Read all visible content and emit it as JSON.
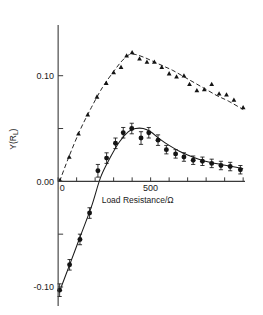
{
  "chart_data": {
    "type": "scatter",
    "title": "",
    "xlabel": "Load Resistance/Ω",
    "ylabel": "Y(Rₗ)",
    "ylabel_parts": {
      "main": "Y(R",
      "sub": "L",
      "tail": ")"
    },
    "xlim": [
      -25,
      1010
    ],
    "ylim": [
      -0.118,
      0.148
    ],
    "grid": false,
    "legend": "none",
    "x_ticks": [
      0,
      100,
      200,
      300,
      400,
      500,
      600,
      700,
      800,
      900,
      1000
    ],
    "x_tick_labels": [
      "0",
      "",
      "",
      "",
      "",
      "500",
      "",
      "",
      "",
      "",
      ""
    ],
    "y_ticks": [
      -0.1,
      -0.05,
      0.0,
      0.05,
      0.1
    ],
    "y_tick_labels": [
      "-0.10",
      "",
      "0.00",
      "",
      "0.10"
    ],
    "series": [
      {
        "name": "upper-series",
        "marker": "triangle",
        "fit_style": "dashed",
        "x": [
          10,
          60,
          110,
          160,
          210,
          260,
          300,
          340,
          370,
          400,
          440,
          480,
          520,
          560,
          600,
          640,
          680,
          710,
          750,
          790,
          830,
          870,
          910,
          950,
          1000
        ],
        "y": [
          0.001,
          0.023,
          0.045,
          0.063,
          0.08,
          0.093,
          0.103,
          0.108,
          0.119,
          0.122,
          0.116,
          0.113,
          0.113,
          0.108,
          0.102,
          0.099,
          0.1,
          0.092,
          0.086,
          0.087,
          0.092,
          0.083,
          0.082,
          0.077,
          0.07
        ],
        "yerr": [
          0,
          0,
          0,
          0,
          0,
          0,
          0,
          0,
          0,
          0,
          0,
          0,
          0,
          0,
          0,
          0,
          0,
          0,
          0,
          0,
          0,
          0,
          0,
          0,
          0
        ],
        "fit_x": [
          8,
          60,
          120,
          180,
          240,
          300,
          345,
          385,
          420,
          470,
          520,
          570,
          620,
          680,
          740,
          800,
          860,
          920,
          1000
        ],
        "fit_y": [
          0.0,
          0.024,
          0.049,
          0.07,
          0.089,
          0.104,
          0.114,
          0.12,
          0.12,
          0.117,
          0.113,
          0.109,
          0.105,
          0.099,
          0.093,
          0.087,
          0.081,
          0.076,
          0.068
        ]
      },
      {
        "name": "lower-series",
        "marker": "circle",
        "fit_style": "solid",
        "x": [
          8,
          62,
          118,
          170,
          215,
          262,
          310,
          352,
          398,
          448,
          490,
          540,
          585,
          635,
          680,
          730,
          780,
          830,
          880,
          930,
          985
        ],
        "y": [
          -0.103,
          -0.079,
          -0.055,
          -0.03,
          0.01,
          0.022,
          0.036,
          0.046,
          0.05,
          0.041,
          0.046,
          0.039,
          0.03,
          0.026,
          0.023,
          0.02,
          0.019,
          0.017,
          0.015,
          0.014,
          0.011
        ],
        "yerr": [
          0.006,
          0.005,
          0.005,
          0.005,
          0.006,
          0.005,
          0.005,
          0.005,
          0.005,
          0.006,
          0.005,
          0.005,
          0.004,
          0.004,
          0.004,
          0.004,
          0.004,
          0.004,
          0.004,
          0.004,
          0.004
        ],
        "fit_x": [
          6,
          60,
          120,
          180,
          230,
          280,
          330,
          380,
          420,
          460,
          500,
          550,
          600,
          650,
          700,
          760,
          820,
          880,
          940,
          1000
        ],
        "fit_y": [
          -0.105,
          -0.08,
          -0.052,
          -0.024,
          0.004,
          0.022,
          0.037,
          0.047,
          0.05,
          0.05,
          0.047,
          0.04,
          0.034,
          0.029,
          0.025,
          0.021,
          0.018,
          0.016,
          0.014,
          0.012
        ]
      }
    ]
  },
  "axes": {
    "x_axis_name": "x-axis",
    "y_axis_name": "y-axis"
  }
}
